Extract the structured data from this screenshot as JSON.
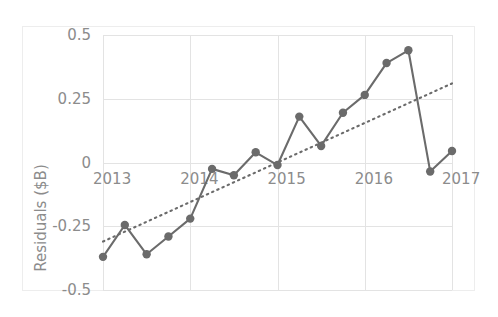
{
  "chart_data": {
    "type": "line",
    "title": "",
    "xlabel": "",
    "ylabel": "Residuals ($B)",
    "xlim": [
      2013,
      2017
    ],
    "ylim": [
      -0.5,
      0.5
    ],
    "grid": true,
    "legend": "none",
    "y_ticks": [
      "0.5",
      "0.25",
      "0",
      "-0.25",
      "-0.5"
    ],
    "y_tick_values": [
      0.5,
      0.25,
      0,
      -0.25,
      -0.5
    ],
    "x_ticks": [
      "2013",
      "2014",
      "2015",
      "2016",
      "2017"
    ],
    "x_tick_values": [
      2013,
      2014,
      2015,
      2016,
      2017
    ],
    "series": [
      {
        "name": "Residuals",
        "type": "line-markers",
        "color": "#6b6b6b",
        "x": [
          2013.0,
          2013.25,
          2014.5,
          2013.75,
          2014.0,
          2014.25,
          2014.5,
          2014.75,
          2015.0,
          2015.25,
          2015.5,
          2015.75,
          2016.0,
          2016.25,
          2016.5,
          2016.75,
          2017.0
        ],
        "x_values": [
          2013.0,
          2013.25,
          2013.5,
          2013.75,
          2014.0,
          2014.25,
          2014.5,
          2014.75,
          2015.0,
          2015.25,
          2015.5,
          2015.75,
          2016.0,
          2016.25,
          2016.5,
          2016.75,
          2017.0
        ],
        "values": [
          -0.37,
          -0.245,
          -0.36,
          -0.29,
          -0.22,
          -0.025,
          -0.05,
          0.04,
          -0.01,
          0.18,
          0.065,
          0.195,
          0.265,
          0.39,
          0.44,
          -0.035,
          0.045
        ]
      },
      {
        "name": "Trend",
        "type": "dotted-trend",
        "color": "#6b6b6b",
        "x_values": [
          2013.0,
          2017.0
        ],
        "values": [
          -0.31,
          0.31
        ]
      }
    ]
  },
  "axes": {
    "y_title": "Residuals ($B)"
  }
}
